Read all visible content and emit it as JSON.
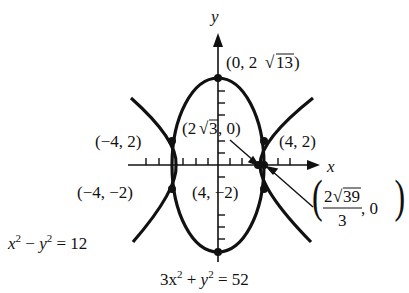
{
  "diagram": {
    "type": "conic-intersection",
    "axes": {
      "x_label": "x",
      "y_label": "y"
    },
    "curves": [
      {
        "name": "hyperbola",
        "equation": "x² − y² = 12"
      },
      {
        "name": "ellipse",
        "equation": "3x² + y² = 52"
      }
    ],
    "points": {
      "ellipse_top": "(0, 2√13)",
      "ellipse_vertex_x": "(2√3, 0)",
      "hyperbola_vertex": "(2√39/3, 0)",
      "intersection_q1": "(4, 2)",
      "intersection_q2": "(−4, 2)",
      "intersection_q3": "(−4, −2)",
      "intersection_q4": "(4, −2)"
    },
    "labels": {
      "top": {
        "open": "(0, 2",
        "radicand": "13",
        "close": ")"
      },
      "vertex_x": {
        "open": "(2",
        "radicand": "3",
        "close": ", 0)"
      },
      "hv": {
        "num_coef": "2",
        "num_radicand": "39",
        "den": "3",
        "tail": ", 0"
      },
      "q1": "(4, 2)",
      "q2": "(−4, 2)",
      "q3": "(−4, −2)",
      "q4": "(4, −2)",
      "hyperbola_eq": {
        "a": "x",
        "minus": " − ",
        "b": "y",
        "rhs": " = 12",
        "exp": "2"
      },
      "ellipse_eq": {
        "a": "3x",
        "plus": " + ",
        "b": "y",
        "rhs": " = 52",
        "exp": "2"
      }
    },
    "colors": {
      "ink": "#111111",
      "background": "#ffffff"
    }
  }
}
